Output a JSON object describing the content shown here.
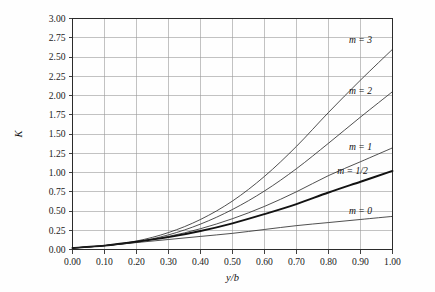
{
  "chart_data": {
    "type": "line",
    "title": "",
    "subtitle": "",
    "xlabel": "y/b",
    "ylabel": "K",
    "xlim": [
      0.0,
      1.0
    ],
    "ylim": [
      0.0,
      3.0
    ],
    "grid": true,
    "legend_position": "inline-right-of-curve-ends",
    "x_tick_labels": [
      "0.00",
      "0.10",
      "0.20",
      "0.30",
      "0.40",
      "0.50",
      "0.60",
      "0.70",
      "0.80",
      "0.90",
      "1.00"
    ],
    "x_tick_values": [
      0.0,
      0.1,
      0.2,
      0.3,
      0.4,
      0.5,
      0.6,
      0.7,
      0.8,
      0.9,
      1.0
    ],
    "y_tick_labels": [
      "0.00",
      "0.25",
      "0.50",
      "0.75",
      "1.00",
      "1.25",
      "1.50",
      "1.75",
      "2.00",
      "2.25",
      "2.50",
      "2.75",
      "3.00"
    ],
    "y_tick_values": [
      0.0,
      0.25,
      0.5,
      0.75,
      1.0,
      1.25,
      1.5,
      1.75,
      2.0,
      2.25,
      2.5,
      2.75,
      3.0
    ],
    "x": [
      0.0,
      0.1,
      0.2,
      0.3,
      0.4,
      0.5,
      0.6,
      0.7,
      0.8,
      0.9,
      1.0
    ],
    "series": [
      {
        "name": "m = 3",
        "label": "m = 3",
        "label_x": 0.9,
        "label_y": 2.72,
        "emphasis": "normal",
        "values": [
          0.02,
          0.05,
          0.11,
          0.22,
          0.39,
          0.63,
          0.95,
          1.34,
          1.78,
          2.2,
          2.6
        ]
      },
      {
        "name": "m = 2",
        "label": "m = 2",
        "label_x": 0.9,
        "label_y": 2.06,
        "emphasis": "normal",
        "values": [
          0.02,
          0.05,
          0.1,
          0.19,
          0.33,
          0.52,
          0.76,
          1.05,
          1.38,
          1.72,
          2.05
        ]
      },
      {
        "name": "m = 1",
        "label": "m = 1",
        "label_x": 0.9,
        "label_y": 1.33,
        "emphasis": "normal",
        "values": [
          0.02,
          0.05,
          0.1,
          0.17,
          0.27,
          0.4,
          0.56,
          0.75,
          0.96,
          1.14,
          1.32
        ]
      },
      {
        "name": "m = 1/2",
        "label": "m = 1/2",
        "label_x": 0.875,
        "label_y": 1.02,
        "emphasis": "bold",
        "values": [
          0.02,
          0.05,
          0.1,
          0.16,
          0.24,
          0.34,
          0.46,
          0.59,
          0.74,
          0.88,
          1.02
        ]
      },
      {
        "name": "m = 0",
        "label": "m = 0",
        "label_x": 0.9,
        "label_y": 0.5,
        "emphasis": "normal",
        "values": [
          0.02,
          0.05,
          0.09,
          0.13,
          0.17,
          0.21,
          0.26,
          0.31,
          0.35,
          0.39,
          0.43
        ]
      }
    ],
    "colors": {
      "curve": "#232323",
      "curve_bold": "#121212",
      "grid": "#9a9a9a",
      "border": "#2b2b2b",
      "background": "#fefefe",
      "text": "#1a1a1a"
    }
  }
}
